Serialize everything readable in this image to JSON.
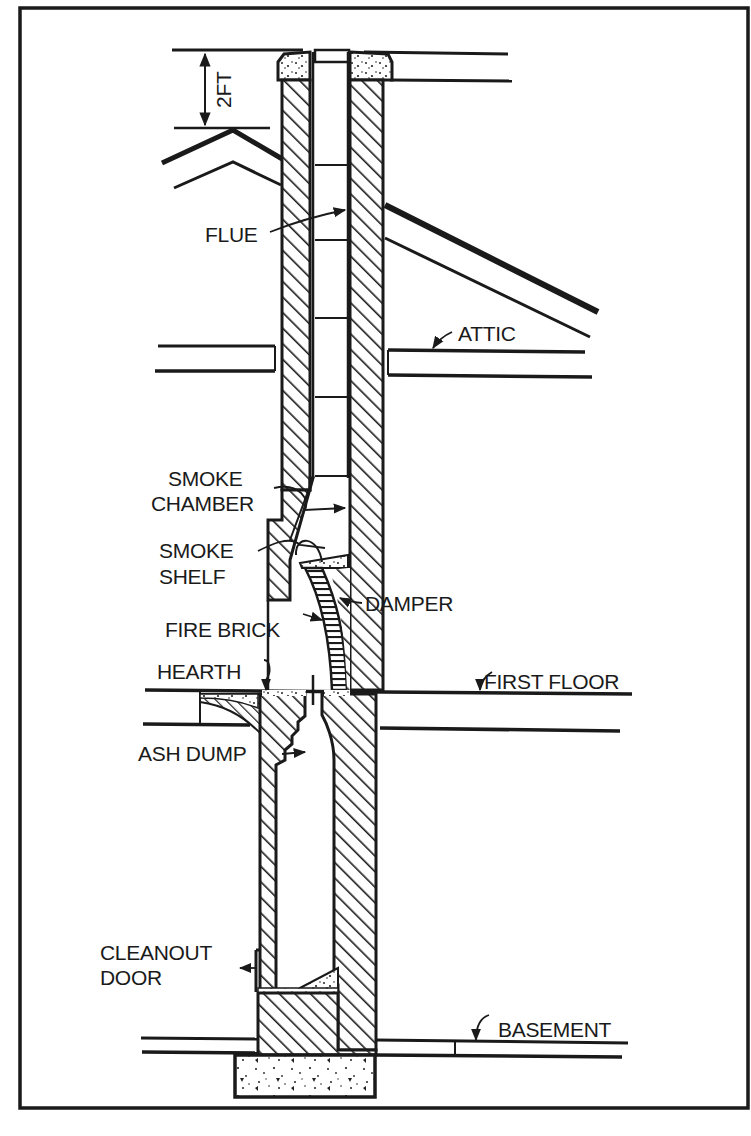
{
  "figure": {
    "type": "cross-section diagram",
    "frame_color": "#1a1a1a",
    "background": "#ffffff",
    "ink": "#1a1a1a"
  },
  "dimension": {
    "label": "2FT"
  },
  "labels": {
    "flue": "FLUE",
    "attic": "ATTIC",
    "smoke_chamber_1": "SMOKE",
    "smoke_chamber_2": "CHAMBER",
    "smoke_shelf_1": "SMOKE",
    "smoke_shelf_2": "SHELF",
    "damper": "DAMPER",
    "fire_brick": "FIRE BRICK",
    "hearth": "HEARTH",
    "first_floor": "FIRST FLOOR",
    "ash_dump": "ASH DUMP",
    "cleanout_door_1": "CLEANOUT",
    "cleanout_door_2": "DOOR",
    "basement": "BASEMENT"
  },
  "caption": {
    "visible": "truncated",
    "text": ""
  }
}
